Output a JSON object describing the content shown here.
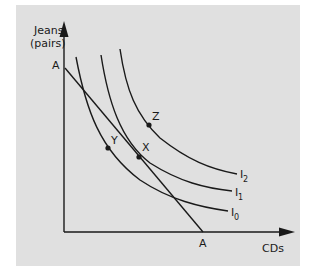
{
  "figure": {
    "type": "indifference-curve-diagram",
    "colors": {
      "background": "#e0e0e0",
      "page": "#ffffff",
      "ink": "#1a1a1a"
    },
    "y_axis": {
      "label_line1": "Jeans",
      "label_line2": "(pairs)"
    },
    "x_axis": {
      "label": "CDs"
    },
    "budget_line": {
      "name": "A",
      "y_intercept_label": "A",
      "x_intercept_label": "A"
    },
    "curves": [
      {
        "id": "I0",
        "label": "I",
        "subscript": "0"
      },
      {
        "id": "I1",
        "label": "I",
        "subscript": "1"
      },
      {
        "id": "I2",
        "label": "I",
        "subscript": "2"
      }
    ],
    "points": [
      {
        "id": "Y",
        "label": "Y",
        "on": "I0"
      },
      {
        "id": "X",
        "label": "X",
        "on": "I1 and budget line A-A (tangency)"
      },
      {
        "id": "Z",
        "label": "Z",
        "on": "I2"
      }
    ]
  }
}
